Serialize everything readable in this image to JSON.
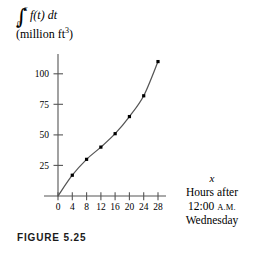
{
  "figure": {
    "caption": "FIGURE 5.25"
  },
  "axis_label_y": {
    "integral_sign": "∫",
    "upper_limit": "x",
    "lower_limit": "0",
    "integrand": "f(t) dt",
    "units": "(million ft",
    "units_exponent": "3",
    "units_close": ")"
  },
  "axis_label_x": {
    "variable": "x",
    "line1": "Hours after",
    "line2_time": "12:00",
    "line2_period": "A.M.",
    "line3": "Wednesday"
  },
  "chart_data": {
    "type": "line",
    "title": "",
    "subtitle": "",
    "xlabel": "x  Hours after 12:00 A.M. Wednesday",
    "ylabel": "∫ from 0 to x of f(t) dt (million ft^3)",
    "x": [
      0,
      4,
      8,
      12,
      16,
      20,
      24,
      28
    ],
    "values": [
      0,
      17,
      30,
      40,
      51,
      65,
      82,
      110
    ],
    "series": [
      {
        "name": "accumulated volume",
        "values": [
          0,
          17,
          30,
          40,
          51,
          65,
          82,
          110
        ]
      }
    ],
    "xticks": [
      0,
      4,
      8,
      12,
      16,
      20,
      24,
      28
    ],
    "xtick_labels": [
      "0",
      "4",
      "8",
      "12",
      "16",
      "20",
      "24",
      "28"
    ],
    "yticks": [
      25,
      50,
      75,
      100
    ],
    "ytick_labels": [
      "25",
      "50",
      "75",
      "100"
    ],
    "xlim": [
      -1.5,
      29.5
    ],
    "ylim": [
      0,
      115
    ],
    "grid": false,
    "legend": "none",
    "markers": "filled-square",
    "line_color": "#555555",
    "marker_color": "#000000",
    "axis_color": "#555555"
  }
}
